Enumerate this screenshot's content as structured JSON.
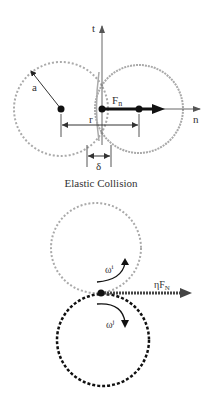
{
  "top_diagram": {
    "axis_t_label": "t",
    "axis_n_label": "n",
    "radius_label": "a",
    "force_label_main": "F",
    "force_label_sub": "n",
    "distance_label": "r",
    "overlap_label": "δ",
    "caption": "Elastic Collision"
  },
  "bottom_diagram": {
    "upper_omega_main": "ω",
    "upper_omega_sup": "i",
    "lower_omega_main": "ω",
    "lower_omega_sup": "j",
    "friction_label_main": "ηF",
    "friction_label_sub": "N"
  },
  "colors": {
    "light_dashed": "#aaaaaa",
    "dark_dashed": "#111111",
    "line": "#555555",
    "arrow": "#111111"
  }
}
